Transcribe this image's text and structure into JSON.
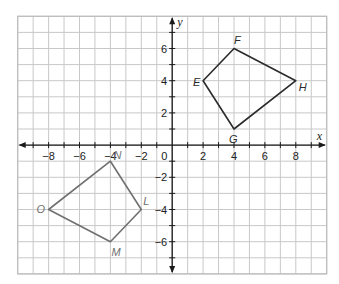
{
  "diagram": {
    "type": "coordinate-plane",
    "grid": {
      "x_min": -10,
      "x_max": 10,
      "y_min": -8,
      "y_max": 8,
      "line_color": "#c8c8c8",
      "border_color": "#bdbdbd"
    },
    "axes": {
      "x_label": "x",
      "y_label": "y",
      "origin_label": "0",
      "color": "#1a1a1a",
      "x_ticks": [
        {
          "value": -8,
          "label": "−8"
        },
        {
          "value": -6,
          "label": "−6"
        },
        {
          "value": -4,
          "label": "−4"
        },
        {
          "value": -2,
          "label": "−2"
        },
        {
          "value": 2,
          "label": "2"
        },
        {
          "value": 4,
          "label": "4"
        },
        {
          "value": 6,
          "label": "6"
        },
        {
          "value": 8,
          "label": "8"
        }
      ],
      "y_ticks": [
        {
          "value": 6,
          "label": "6"
        },
        {
          "value": 4,
          "label": "4"
        },
        {
          "value": 2,
          "label": "2"
        },
        {
          "value": -2,
          "label": "−2"
        },
        {
          "value": -4,
          "label": "−4"
        },
        {
          "value": -6,
          "label": "−6"
        }
      ]
    },
    "shapes": [
      {
        "name": "EFHG",
        "stroke": "#2b2b2b",
        "label_color": "#2b2b2b",
        "vertices": [
          {
            "label": "E",
            "x": 2,
            "y": 4,
            "dx": -10,
            "dy": 5
          },
          {
            "label": "F",
            "x": 4,
            "y": 6,
            "dx": 0,
            "dy": -5
          },
          {
            "label": "H",
            "x": 8,
            "y": 4,
            "dx": 3,
            "dy": 10
          },
          {
            "label": "G",
            "x": 4,
            "y": 1,
            "dx": -5,
            "dy": 14
          }
        ]
      },
      {
        "name": "NOML",
        "stroke": "#707070",
        "label_color": "#707070",
        "vertices": [
          {
            "label": "N",
            "x": -4,
            "y": -1,
            "dx": 3,
            "dy": -2
          },
          {
            "label": "O",
            "x": -8,
            "y": -4,
            "dx": -12,
            "dy": 3
          },
          {
            "label": "M",
            "x": -4,
            "y": -6,
            "dx": 1,
            "dy": 14
          },
          {
            "label": "L",
            "x": -2,
            "y": -4,
            "dx": 2,
            "dy": -5
          }
        ]
      }
    ]
  }
}
